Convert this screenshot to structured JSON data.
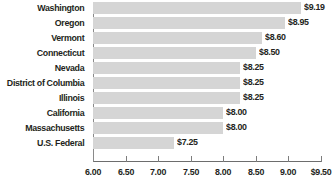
{
  "chart_data": {
    "type": "bar",
    "orientation": "horizontal",
    "title": "",
    "xlabel": "",
    "ylabel": "",
    "xlim": [
      6.0,
      9.5
    ],
    "grid": false,
    "legend": null,
    "bar_color": "#d5d5d5",
    "text_color": "#231f20",
    "axis_color": "#7d7d7d",
    "categories": [
      "Washington",
      "Oregon",
      "Vermont",
      "Connecticut",
      "Nevada",
      "District of Columbia",
      "Illinois",
      "California",
      "Massachusetts",
      "U.S. Federal"
    ],
    "values": [
      9.19,
      8.95,
      8.6,
      8.5,
      8.25,
      8.25,
      8.25,
      8.0,
      8.0,
      7.25
    ],
    "value_labels": [
      "$9.19",
      "$8.95",
      "$8.60",
      "$8.50",
      "$8.25",
      "$8.25",
      "$8.25",
      "$8.00",
      "$8.00",
      "$7.25"
    ],
    "xticks": [
      6.0,
      6.5,
      7.0,
      7.5,
      8.0,
      8.5,
      9.0,
      9.5
    ],
    "xtick_labels": [
      "6.00",
      "6.50",
      "7.00",
      "7.50",
      "8.00",
      "8.50",
      "9.00",
      "$9.50"
    ]
  }
}
